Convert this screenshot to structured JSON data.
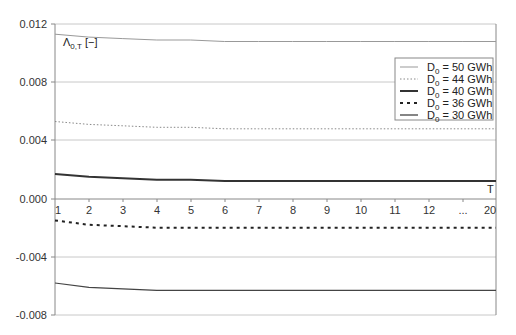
{
  "chart_data": {
    "type": "line",
    "title": "",
    "ylabel": "Λ0,T [−]",
    "xlabel": "T",
    "ylim": [
      -0.008,
      0.012
    ],
    "yticks": [
      "0.012",
      "0.008",
      "0.004",
      "0.000",
      "-0.004",
      "-0.008"
    ],
    "categories": [
      "1",
      "2",
      "3",
      "4",
      "5",
      "6",
      "7",
      "8",
      "9",
      "10",
      "11",
      "12",
      "...",
      "20"
    ],
    "grid": true,
    "legend_position": "upper right",
    "series": [
      {
        "name": "D0 = 50 GWh",
        "style": "solid-thin",
        "values": [
          0.0113,
          0.0111,
          0.011,
          0.0109,
          0.0109,
          0.0108,
          0.0108,
          0.0108,
          0.0108,
          0.0108,
          0.0108,
          0.0108,
          0.0108,
          0.0108
        ]
      },
      {
        "name": "D0 = 44 GWh",
        "style": "dotted",
        "values": [
          0.0053,
          0.0051,
          0.005,
          0.0049,
          0.0049,
          0.0048,
          0.0048,
          0.0048,
          0.0048,
          0.0048,
          0.0048,
          0.0048,
          0.0048,
          0.0048
        ]
      },
      {
        "name": "D0 = 40 GWh",
        "style": "solid-thick",
        "values": [
          0.0017,
          0.0015,
          0.0014,
          0.0013,
          0.0013,
          0.0012,
          0.0012,
          0.0012,
          0.0012,
          0.0012,
          0.0012,
          0.0012,
          0.0012,
          0.0012
        ]
      },
      {
        "name": "D0 = 36 GWh",
        "style": "dashed",
        "values": [
          -0.0015,
          -0.0018,
          -0.0019,
          -0.002,
          -0.002,
          -0.002,
          -0.002,
          -0.002,
          -0.002,
          -0.002,
          -0.002,
          -0.002,
          -0.002,
          -0.002
        ]
      },
      {
        "name": "D0 = 30 GWh",
        "style": "solid",
        "values": [
          -0.0058,
          -0.0061,
          -0.0062,
          -0.0063,
          -0.0063,
          -0.0063,
          -0.0063,
          -0.0063,
          -0.0063,
          -0.0063,
          -0.0063,
          -0.0063,
          -0.0063,
          -0.0063
        ]
      }
    ]
  },
  "axis": {
    "y_label_main": "Λ",
    "y_label_sub": "0,T",
    "y_label_unit": " [−]",
    "x_label": "T"
  },
  "legend": [
    {
      "prefix": "D",
      "sub": "0",
      "text": " = 50 GWh"
    },
    {
      "prefix": "D",
      "sub": "0",
      "text": " = 44 GWh"
    },
    {
      "prefix": "D",
      "sub": "0",
      "text": " = 40 GWh"
    },
    {
      "prefix": "D",
      "sub": "0",
      "text": " = 36 GWh"
    },
    {
      "prefix": "D",
      "sub": "0",
      "text": " = 30 GWh"
    }
  ]
}
